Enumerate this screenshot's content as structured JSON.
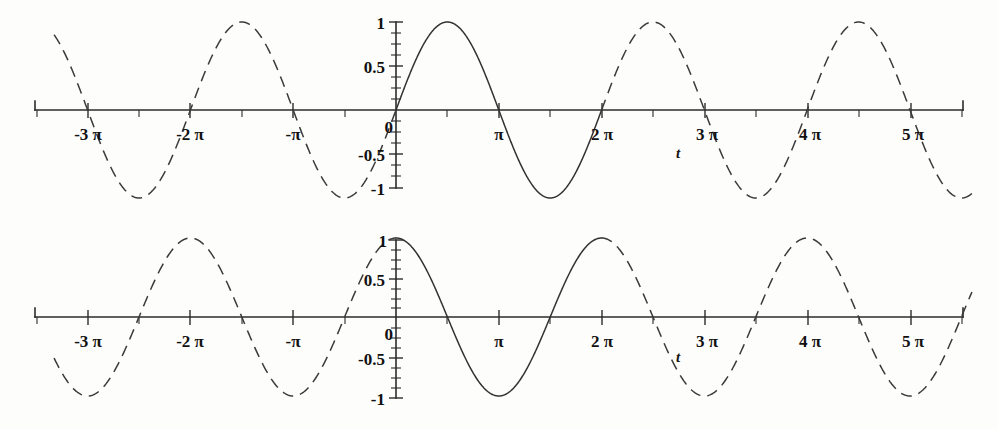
{
  "figure": {
    "background_color": "#fdfdfc",
    "curve_color": "#333333",
    "axis_color": "#2b2b2b",
    "panel_count": 2
  },
  "chart_data": [
    {
      "type": "line",
      "title": "",
      "subtitle": "",
      "xlabel": "t",
      "ylabel": "",
      "function": "sin(t)",
      "grid": false,
      "legend": null,
      "xlim": [
        -10.45,
        17.6
      ],
      "ylim": [
        -1,
        1
      ],
      "x_tick_labels": [
        "-3 π",
        "-2 π",
        "-π",
        "0",
        "π",
        "2 π",
        "3 π",
        "4 π",
        "5 π"
      ],
      "x_tick_values": [
        -9.4248,
        -6.2832,
        -3.1416,
        0,
        3.1416,
        6.2832,
        9.4248,
        12.5664,
        15.708
      ],
      "x_minor_tick_step_label": "π/2",
      "y_tick_labels": [
        "1",
        "0.5",
        "0",
        "-0.5",
        "-1"
      ],
      "y_tick_values": [
        1,
        0.5,
        0,
        -0.5,
        -1
      ],
      "solid_segment": [
        0,
        6.2832
      ],
      "dashed_segments": [
        [
          -10.45,
          0
        ],
        [
          6.2832,
          17.6
        ]
      ],
      "x": [
        -10.45,
        -9.4248,
        -7.854,
        -6.2832,
        -4.7124,
        -3.1416,
        -1.5708,
        0,
        1.5708,
        3.1416,
        4.7124,
        6.2832,
        7.854,
        9.4248,
        10.9956,
        12.5664,
        14.1372,
        15.708,
        17.279
      ],
      "values": [
        0.85,
        0,
        1,
        0,
        -1,
        0,
        1,
        0,
        1,
        0,
        -1,
        0,
        1,
        0,
        -1,
        0,
        1,
        0,
        -1
      ]
    },
    {
      "type": "line",
      "title": "",
      "subtitle": "",
      "xlabel": "t",
      "ylabel": "",
      "function": "cos(t)",
      "grid": false,
      "legend": null,
      "xlim": [
        -10.45,
        17.6
      ],
      "ylim": [
        -1,
        1
      ],
      "x_tick_labels": [
        "-3 π",
        "-2 π",
        "-π",
        "0",
        "π",
        "2 π",
        "3 π",
        "4 π",
        "5 π"
      ],
      "x_tick_values": [
        -9.4248,
        -6.2832,
        -3.1416,
        0,
        3.1416,
        6.2832,
        9.4248,
        12.5664,
        15.708
      ],
      "x_minor_tick_step_label": "π/2",
      "y_tick_labels": [
        "1",
        "0.5",
        "0",
        "-0.5",
        "-1"
      ],
      "y_tick_values": [
        1,
        0.5,
        0,
        -0.5,
        -1
      ],
      "solid_segment": [
        0,
        6.2832
      ],
      "dashed_segments": [
        [
          -10.45,
          0
        ],
        [
          6.2832,
          17.6
        ]
      ],
      "x": [
        -10.45,
        -9.4248,
        -7.854,
        -6.2832,
        -4.7124,
        -3.1416,
        -1.5708,
        0,
        1.5708,
        3.1416,
        4.7124,
        6.2832,
        7.854,
        9.4248,
        10.9956,
        12.5664,
        14.1372,
        15.708,
        17.279
      ],
      "values": [
        -0.53,
        -1,
        0,
        1,
        0,
        -1,
        0,
        1,
        0,
        -1,
        0,
        1,
        0,
        -1,
        0,
        1,
        0,
        -1,
        0
      ]
    }
  ],
  "sine_panel": {
    "name": "sine-plot",
    "axis_label": "t",
    "y_labels": {
      "one": "1",
      "half": "0.5",
      "zero": "0",
      "neg_half": "-0.5",
      "neg_one": "-1"
    },
    "x_labels": {
      "neg3pi": "-3 π",
      "neg2pi": "-2 π",
      "neg1pi": "-π",
      "pi": "π",
      "twopi": "2 π",
      "threepi": "3 π",
      "fourpi": "4 π",
      "fivepi": "5 π"
    }
  },
  "cosine_panel": {
    "name": "cosine-plot",
    "axis_label": "t",
    "y_labels": {
      "one": "1",
      "half": "0.5",
      "zero": "0",
      "neg_half": "-0.5",
      "neg_one": "-1"
    },
    "x_labels": {
      "neg3pi": "-3 π",
      "neg2pi": "-2 π",
      "neg1pi": "-π",
      "pi": "π",
      "twopi": "2 π",
      "threepi": "3 π",
      "fourpi": "4 π",
      "fivepi": "5 π"
    }
  }
}
